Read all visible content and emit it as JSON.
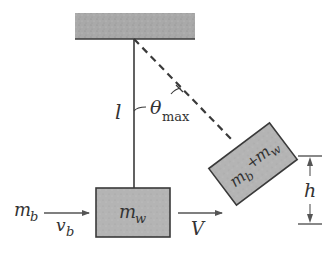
{
  "figure": {
    "type": "ballistic-pendulum",
    "colors": {
      "ceiling_fill": "#a9a9a9",
      "block_fill": "#b5b5b5",
      "line": "#3a3a3a",
      "text": "#333333",
      "background": "#ffffff"
    }
  },
  "labels": {
    "string_length": "l",
    "theta": "θ",
    "theta_sub": "max",
    "bullet_mass": "m",
    "bullet_mass_sub": "b",
    "bullet_velocity": "v",
    "bullet_velocity_sub": "b",
    "block_mass": "m",
    "block_mass_sub": "w",
    "final_velocity": "V",
    "combined_mass": "m",
    "combined_mass_sub1": "b",
    "combined_plus": "+",
    "combined_mass2": "m",
    "combined_mass_sub2": "w",
    "height": "h"
  }
}
